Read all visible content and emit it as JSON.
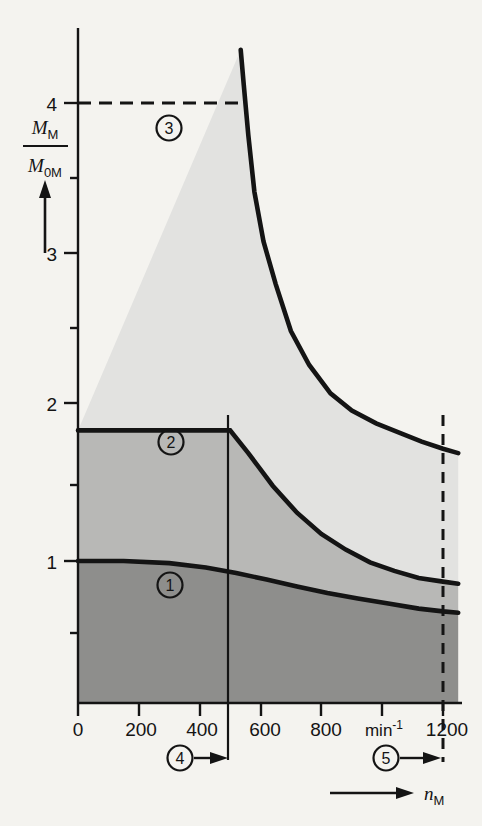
{
  "figure": {
    "background_color": "#f4f3ef",
    "line_color": "#141414"
  },
  "axes": {
    "y_title_numerator": "M",
    "y_title_numerator_sub": "M",
    "y_title_denominator": "M",
    "y_title_denominator_sub": "0M",
    "x_title": "n",
    "x_title_sub": "M",
    "x_unit": "min",
    "x_unit_exp": "-1",
    "y_ticks": [
      "0",
      "1",
      "2",
      "3",
      "4"
    ],
    "x_ticks": [
      "0",
      "200",
      "400",
      "600",
      "800",
      "1200"
    ]
  },
  "callouts": [
    {
      "id": "region-1",
      "label": "1"
    },
    {
      "id": "region-2",
      "label": "2"
    },
    {
      "id": "region-3",
      "label": "3"
    },
    {
      "id": "marker-4",
      "label": "4"
    },
    {
      "id": "marker-5",
      "label": "5"
    }
  ],
  "regions": {
    "region_1_color": "#8e8e8c",
    "region_2_color": "#b8b8b6",
    "region_3_color": "#e2e2e0"
  },
  "chart_data": {
    "type": "area",
    "title": "",
    "xlabel": "n_M",
    "ylabel": "M_M / M_0M",
    "xlim": [
      0,
      1250
    ],
    "ylim": [
      0,
      4.6
    ],
    "x_unit": "min^-1",
    "grid": false,
    "legend": "none",
    "x_major_ticks": [
      0,
      200,
      400,
      600,
      800,
      1000,
      1200
    ],
    "x_labeled_ticks": [
      0,
      200,
      400,
      600,
      800,
      1200
    ],
    "y_major_ticks": [
      0,
      1,
      2,
      3,
      4
    ],
    "y_minor_ticks": [
      0.5,
      1.5,
      2.5,
      3.5,
      4.5
    ],
    "annotations": [
      {
        "label": "3",
        "x": 330,
        "y": 3.75,
        "region": "upper light-gray band"
      },
      {
        "label": "2",
        "x": 290,
        "y": 1.72,
        "region": "middle mid-gray band"
      },
      {
        "label": "1",
        "x": 290,
        "y": 0.78,
        "region": "lower dark-gray band"
      },
      {
        "label": "4",
        "x": 390,
        "y": -0.37,
        "note": "arrow points right to 500 min^-1 boundary"
      },
      {
        "label": "5",
        "x": 1060,
        "y": -0.37,
        "note": "arrow points right to 1200 min^-1 boundary"
      }
    ],
    "reference_lines": [
      {
        "name": "dashed-4-line",
        "type": "horizontal-dashed",
        "y": 4.0,
        "x_from": 0,
        "x_to": 500
      },
      {
        "name": "vertical-500",
        "type": "vertical-solid",
        "x": 500,
        "y_from": -0.45,
        "y_to": 1.92
      },
      {
        "name": "vertical-1200-dashed",
        "type": "vertical-dashed",
        "x": 1200,
        "y_from": -0.4,
        "y_to": 1.92
      }
    ],
    "series": [
      {
        "name": "upper boundary (max short-time torque)",
        "description": "hyperbolic constant-power limit bounding region 3",
        "x": [
          535,
          545,
          560,
          580,
          610,
          650,
          700,
          760,
          830,
          900,
          980,
          1060,
          1130,
          1200,
          1250
        ],
        "values": [
          4.6,
          4.35,
          4.0,
          3.6,
          3.25,
          2.95,
          2.62,
          2.38,
          2.18,
          2.06,
          1.97,
          1.9,
          1.84,
          1.79,
          1.76
        ]
      },
      {
        "name": "middle boundary (continuous torque limit)",
        "description": "constant at 1.92 to 500 min^-1 then falling hyperbolically",
        "x": [
          0,
          200,
          400,
          500,
          560,
          640,
          720,
          800,
          880,
          960,
          1040,
          1120,
          1200,
          1250
        ],
        "values": [
          1.92,
          1.92,
          1.92,
          1.92,
          1.76,
          1.53,
          1.34,
          1.19,
          1.08,
          0.99,
          0.93,
          0.88,
          0.855,
          0.84
        ]
      },
      {
        "name": "lower boundary (rated torque)",
        "description": "starts at 1.0, gently declining to about 0.63",
        "x": [
          0,
          150,
          300,
          420,
          520,
          620,
          720,
          820,
          920,
          1020,
          1120,
          1200,
          1250
        ],
        "values": [
          1.0,
          1.0,
          0.985,
          0.955,
          0.915,
          0.87,
          0.82,
          0.775,
          0.735,
          0.7,
          0.665,
          0.645,
          0.635
        ]
      }
    ],
    "bands": [
      {
        "name": "region 1",
        "label": "1",
        "between": [
          "x-axis",
          "lower boundary"
        ],
        "fill": "#8e8e8c"
      },
      {
        "name": "region 2",
        "label": "2",
        "between": [
          "lower boundary",
          "middle boundary"
        ],
        "fill": "#b8b8b6"
      },
      {
        "name": "region 3",
        "label": "3",
        "between": [
          "middle boundary",
          "upper boundary"
        ],
        "fill": "#e2e2e0"
      }
    ]
  }
}
